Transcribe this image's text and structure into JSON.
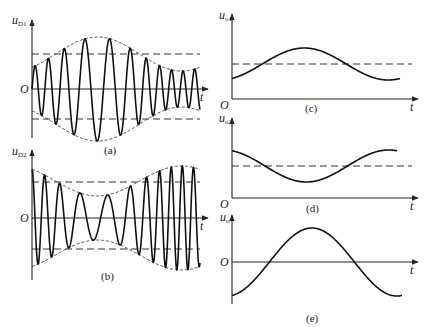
{
  "figure": {
    "panels": [
      {
        "id": "a",
        "caption": "(a)",
        "ylabel_main": "u",
        "ylabel_sub": "D1",
        "origin": "O",
        "xlabel": "t",
        "description": "Amplitude-modulated carrier with envelope bulging to maximum near middle, dashed reference levels above and below"
      },
      {
        "id": "b",
        "caption": "(b)",
        "ylabel_main": "u",
        "ylabel_sub": "D2",
        "origin": "O",
        "xlabel": "t",
        "description": "Amplitude-modulated carrier with envelope pinched to minimum near middle, dashed reference levels"
      },
      {
        "id": "c",
        "caption": "(c)",
        "ylabel_main": "u",
        "ylabel_sub": "o1",
        "origin": "O",
        "xlabel": "t",
        "description": "Detected envelope: sinusoid riding on DC level (dashed), rising first"
      },
      {
        "id": "d",
        "caption": "(d)",
        "ylabel_main": "u",
        "ylabel_sub": "o2",
        "origin": "O",
        "xlabel": "t",
        "description": "Detected envelope: sinusoid riding on DC level (dashed), falling first"
      },
      {
        "id": "e",
        "caption": "(e)",
        "ylabel_main": "u",
        "ylabel_sub": "o",
        "origin": "O",
        "xlabel": "t",
        "description": "Difference output: sinusoid centered on zero"
      }
    ]
  }
}
